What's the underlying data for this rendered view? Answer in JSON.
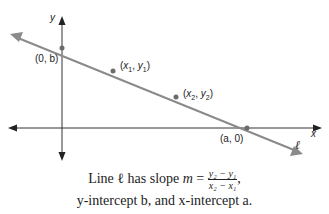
{
  "diagram": {
    "axes": {
      "x_label": "x",
      "y_label": "y"
    },
    "line_label": "ℓ",
    "points": [
      {
        "label": "(0, b)",
        "name": "y-intercept"
      },
      {
        "label": "(x1, y1)",
        "name": "point-1"
      },
      {
        "label": "(x2, y2)",
        "name": "point-2"
      },
      {
        "label": "(a, 0)",
        "name": "x-intercept"
      }
    ],
    "colors": {
      "line": "#8a8a8a",
      "axes": "#333333",
      "point": "#6b6b6b"
    }
  },
  "caption": {
    "line1_prefix": "Line ℓ has slope ",
    "m": "m",
    "equals": " = ",
    "numerator": "y₂ − y₁",
    "denominator": "x₂ − x₁",
    "line1_suffix": ",",
    "line2": "y-intercept b, and x-intercept a."
  }
}
